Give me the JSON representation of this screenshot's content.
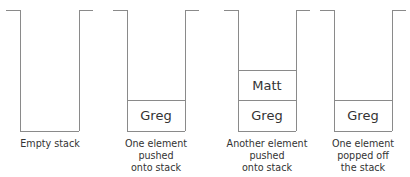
{
  "stacks": [
    {
      "caption": "Empty stack",
      "elements": []
    },
    {
      "caption": "One element pushed onto stack",
      "elements": [
        "Greg"
      ]
    },
    {
      "caption": "Another element pushed onto stack",
      "elements": [
        "Greg",
        "Matt"
      ]
    },
    {
      "caption": "One element popped off the stack",
      "elements": [
        "Greg"
      ]
    }
  ],
  "captions": {
    "s0": [
      "Empty stack"
    ],
    "s1": [
      "One element",
      "pushed",
      "onto stack"
    ],
    "s2": [
      "Another element",
      "pushed",
      "onto stack"
    ],
    "s3": [
      "One element",
      "popped off",
      "the stack"
    ]
  },
  "cells": {
    "s1_bottom": "Greg",
    "s2_top": "Matt",
    "s2_bottom": "Greg",
    "s3_bottom": "Greg"
  },
  "colors": {
    "line": "#8a8a8a",
    "text": "#333333"
  }
}
